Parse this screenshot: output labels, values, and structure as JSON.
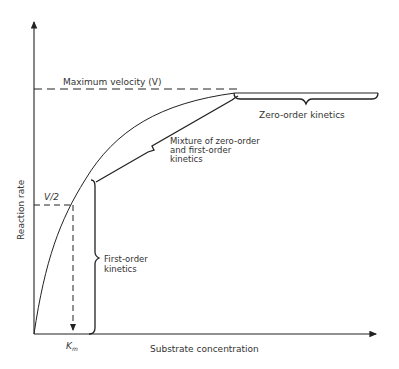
{
  "diagram": {
    "type": "michaelis-menten-curve",
    "y_axis_label": "Reaction rate",
    "x_axis_label": "Substrate concentration",
    "vmax_label": "Maximum velocity (V)",
    "half_vmax_label": "V/2",
    "km_label": "K",
    "km_subscript": "m",
    "regions": {
      "first_order": [
        "First-order",
        "kinetics"
      ],
      "mixture": [
        "Mixture of zero-order",
        "and first-order",
        "kinetics"
      ],
      "zero_order": "Zero-order kinetics"
    },
    "colors": {
      "line": "#222222",
      "text": "#333333",
      "background": "#ffffff"
    }
  }
}
